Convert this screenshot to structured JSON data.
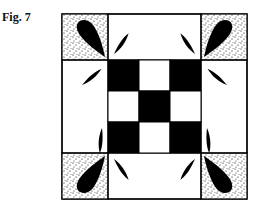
{
  "figure": {
    "caption": "Fig. 7",
    "colors": {
      "ink": "#000000",
      "background": "#ffffff",
      "stipple": "#000000"
    },
    "grid": {
      "outer": {
        "x": 62,
        "y": 14,
        "size": 185
      },
      "corner_size": 46,
      "center": {
        "rows": 3,
        "cols": 3,
        "pattern": [
          [
            1,
            0,
            1
          ],
          [
            0,
            1,
            0
          ],
          [
            1,
            0,
            1
          ]
        ]
      }
    }
  }
}
